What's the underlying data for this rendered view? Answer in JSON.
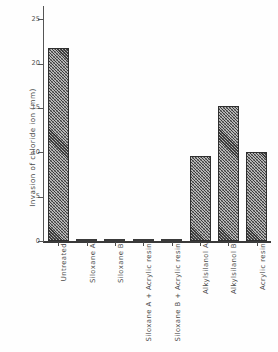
{
  "chart_data": {
    "type": "bar",
    "title": "",
    "xlabel": "",
    "ylabel": "Invasion of chloride ion (mm)",
    "categories": [
      "Untreated",
      "Siloxane A",
      "Siloxane B",
      "Siloxane A + Acrylic resin",
      "Siloxane B + Acrylic resin",
      "Alkylsilanol A",
      "Alkylsilanol B",
      "Acrylic resin"
    ],
    "values": [
      21.8,
      0,
      0,
      0,
      0,
      9.6,
      15.2,
      10.0
    ],
    "ylim": [
      0,
      26.5
    ],
    "yticks": [
      0,
      5,
      10,
      15,
      20,
      25
    ],
    "ytick_labels": [
      "0",
      "5",
      "10",
      "15",
      "20",
      "25"
    ],
    "grid": false,
    "legend": false,
    "bar_fill": "diagonal-hatch",
    "bar_color": "#b9b9b9",
    "bar_edge_color": "#2f2f2f",
    "axis_color": "#555555"
  }
}
